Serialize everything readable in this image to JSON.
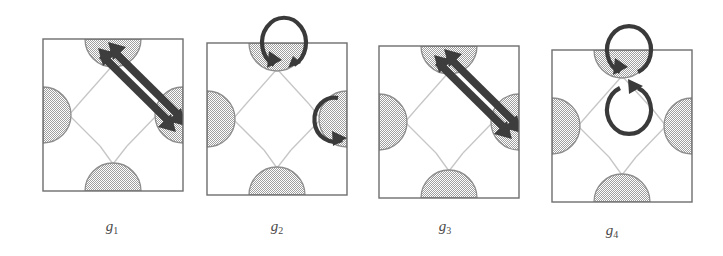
{
  "figure": {
    "type": "lattice-symmetry-diagram",
    "panel_count": 4,
    "colors": {
      "atom_fill": "#b8b8b8",
      "atom_stroke": "#8a8a8a",
      "cell_border": "#6e6e6e",
      "bond_line": "#c9c9c9",
      "arrow": "#3a3a3a",
      "background": "#ffffff",
      "caption_text": "#4a4a4a"
    },
    "panels": [
      {
        "id": "panel-1",
        "label_base": "g",
        "label_sub": "1",
        "label_full": "g1",
        "cell": {
          "x": 42,
          "y": 38,
          "width": 140,
          "height": 152
        },
        "atoms": [
          {
            "name": "atom-top",
            "position": "top-edge-midpoint"
          },
          {
            "name": "atom-left",
            "position": "left-edge-midpoint"
          },
          {
            "name": "atom-right",
            "position": "right-edge-midpoint"
          },
          {
            "name": "atom-bottom",
            "position": "bottom-edge-midpoint"
          }
        ],
        "operation": "translation",
        "operation_symbol": "double-headed-arrow",
        "arrow": {
          "kind": "double-arrow",
          "from": "atom-top",
          "to": "atom-right",
          "direction": "diagonal-down-right"
        }
      },
      {
        "id": "panel-2",
        "label_base": "g",
        "label_sub": "2",
        "label_full": "g2",
        "cell": {
          "x": 207,
          "y": 43,
          "width": 140,
          "height": 152
        },
        "atoms": [
          {
            "name": "atom-top",
            "position": "top-edge-midpoint"
          },
          {
            "name": "atom-left",
            "position": "left-edge-midpoint"
          },
          {
            "name": "atom-right",
            "position": "right-edge-midpoint"
          },
          {
            "name": "atom-bottom",
            "position": "bottom-edge-midpoint"
          }
        ],
        "operation": "rotation",
        "operation_symbol": "circular-loop-arrow",
        "loops": [
          {
            "name": "loop-top",
            "anchor": "atom-top",
            "orientation": "above"
          },
          {
            "name": "loop-right",
            "anchor": "atom-right",
            "orientation": "left-of"
          }
        ]
      },
      {
        "id": "panel-3",
        "label_base": "g",
        "label_sub": "3",
        "label_full": "g3",
        "cell": {
          "x": 378,
          "y": 45,
          "width": 140,
          "height": 152
        },
        "atoms": [
          {
            "name": "atom-top",
            "position": "top-edge-midpoint"
          },
          {
            "name": "atom-left",
            "position": "left-edge-midpoint"
          },
          {
            "name": "atom-right",
            "position": "right-edge-midpoint"
          },
          {
            "name": "atom-bottom",
            "position": "bottom-edge-midpoint"
          }
        ],
        "operation": "translation",
        "operation_symbol": "double-headed-arrow",
        "arrow": {
          "kind": "double-arrow",
          "from": "atom-top",
          "to": "atom-right",
          "direction": "diagonal-down-right"
        }
      },
      {
        "id": "panel-4",
        "label_base": "g",
        "label_sub": "4",
        "label_full": "g4",
        "cell": {
          "x": 549,
          "y": 50,
          "width": 140,
          "height": 152
        },
        "atoms": [
          {
            "name": "atom-top",
            "position": "top-edge-midpoint"
          },
          {
            "name": "atom-left",
            "position": "left-edge-midpoint"
          },
          {
            "name": "atom-right",
            "position": "right-edge-midpoint"
          },
          {
            "name": "atom-bottom",
            "position": "bottom-edge-midpoint"
          }
        ],
        "operation": "double-rotation",
        "operation_symbol": "stacked-circular-loop-arrows",
        "loops": [
          {
            "name": "loop-upper",
            "anchor": "atom-top",
            "orientation": "above"
          },
          {
            "name": "loop-lower",
            "anchor": "atom-top",
            "orientation": "below"
          }
        ]
      }
    ]
  }
}
